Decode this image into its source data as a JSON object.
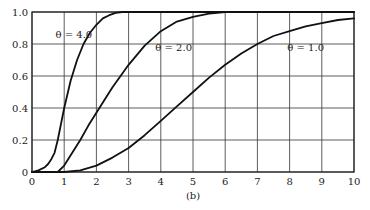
{
  "chart_data": {
    "type": "line",
    "title": "",
    "caption": "(b)",
    "xlabel": "",
    "ylabel": "",
    "xlim": [
      0,
      10
    ],
    "ylim": [
      0,
      1.0
    ],
    "grid": true,
    "x_ticks": [
      0,
      1,
      2,
      3,
      4,
      5,
      6,
      7,
      8,
      9,
      10
    ],
    "y_ticks": [
      0,
      0.2,
      0.4,
      0.6,
      0.8,
      1.0
    ],
    "y_tick_labels": [
      "0",
      "0.2",
      "0.4",
      "0.6",
      "0.8",
      "1.0"
    ],
    "x_tick_labels": [
      "0",
      "1",
      "2",
      "3",
      "4",
      "5",
      "6",
      "7",
      "8",
      "9",
      "10"
    ],
    "legend": "none (inline curve labels)",
    "series": [
      {
        "name": "θ = 4.0",
        "label_pos": [
          1.3,
          0.86
        ],
        "x": [
          0,
          0.2,
          0.4,
          0.5,
          0.6,
          0.7,
          0.8,
          0.9,
          1.0,
          1.2,
          1.4,
          1.6,
          1.8,
          2.0,
          2.2,
          2.4,
          2.6,
          2.8,
          3.0,
          10
        ],
        "y": [
          0,
          0.01,
          0.03,
          0.05,
          0.08,
          0.12,
          0.2,
          0.3,
          0.4,
          0.57,
          0.7,
          0.8,
          0.87,
          0.92,
          0.96,
          0.98,
          0.995,
          1.0,
          1.0,
          1.0
        ]
      },
      {
        "name": "θ = 2.0",
        "label_pos": [
          4.4,
          0.78
        ],
        "x": [
          0,
          0.8,
          1.0,
          1.25,
          1.5,
          1.75,
          2.0,
          2.5,
          3.0,
          3.5,
          4.0,
          4.5,
          5.0,
          5.5,
          6.0,
          10
        ],
        "y": [
          0,
          0,
          0.04,
          0.12,
          0.2,
          0.29,
          0.37,
          0.53,
          0.67,
          0.79,
          0.88,
          0.94,
          0.97,
          0.99,
          1.0,
          1.0
        ]
      },
      {
        "name": "θ = 1.0",
        "label_pos": [
          8.5,
          0.78
        ],
        "x": [
          0,
          1.0,
          1.5,
          2.0,
          2.5,
          3.0,
          3.5,
          4.0,
          4.5,
          5.0,
          5.5,
          6.0,
          6.5,
          7.0,
          7.5,
          8.0,
          8.5,
          9.0,
          9.5,
          10.0
        ],
        "y": [
          0,
          0,
          0.01,
          0.04,
          0.09,
          0.15,
          0.23,
          0.32,
          0.41,
          0.5,
          0.59,
          0.67,
          0.74,
          0.8,
          0.85,
          0.88,
          0.91,
          0.93,
          0.95,
          0.96
        ]
      }
    ]
  },
  "labels": {
    "caption": "(b)"
  }
}
